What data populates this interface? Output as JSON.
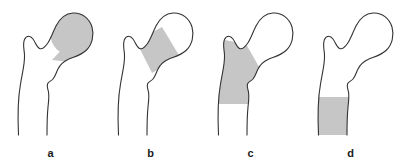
{
  "figure": {
    "background_color": "#ffffff",
    "outline_color": "#333333",
    "shade_color": "#c6c6c6",
    "panel_count": 4
  },
  "panels": [
    {
      "label": "a",
      "region_name": "femoral-head",
      "region_description": "Femoral head shaded",
      "shade_color": "#c6c6c6",
      "outline_color": "#333333"
    },
    {
      "label": "b",
      "region_name": "femoral-neck",
      "region_description": "Femoral neck shaded as a diagonal band",
      "shade_color": "#c6c6c6",
      "outline_color": "#333333"
    },
    {
      "label": "c",
      "region_name": "trochanteric-region",
      "region_description": "Trochanteric and intertrochanteric region shaded",
      "shade_color": "#c6c6c6",
      "outline_color": "#333333"
    },
    {
      "label": "d",
      "region_name": "subtrochanteric-shaft",
      "region_description": "Subtrochanteric shaft shaded as a rectangular band",
      "shade_color": "#c6c6c6",
      "outline_color": "#333333"
    }
  ]
}
